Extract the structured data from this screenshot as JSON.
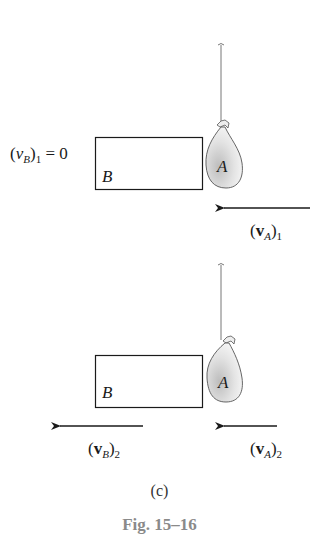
{
  "panel_top": {
    "vB_label": {
      "open": "(",
      "var": "v",
      "sub_var": "B",
      "close": ")",
      "sub_idx": "1",
      "rest": " = 0"
    },
    "block_label": "B",
    "bag_label": "A",
    "vA_label": {
      "open": "(",
      "var": "v",
      "sub_var": "A",
      "close": ")",
      "sub_idx": "1"
    }
  },
  "panel_bottom": {
    "block_label": "B",
    "bag_label": "A",
    "vB_label": {
      "open": "(",
      "var": "v",
      "sub_var": "B",
      "close": ")",
      "sub_idx": "2"
    },
    "vA_label": {
      "open": "(",
      "var": "v",
      "sub_var": "A",
      "close": ")",
      "sub_idx": "2"
    }
  },
  "panel_label": "(c)",
  "figure_caption": "Fig. 15–16",
  "colors": {
    "line": "#1a1a1a",
    "string": "#777777",
    "caption": "#8a8a8a"
  }
}
